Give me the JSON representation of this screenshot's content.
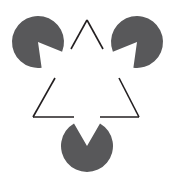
{
  "figure": {
    "canvas": {
      "width": 174,
      "height": 182,
      "background": "#ffffff"
    },
    "colors": {
      "disc_fill": "#58585a",
      "outline_stroke": "#231f20",
      "background": "#ffffff"
    },
    "geometry": {
      "disc_radius": 26,
      "outline_stroke_width": 1.6,
      "notch_half_angle_deg": 30
    },
    "discs": [
      {
        "name": "top-left-pacman",
        "label": "Top-left pac-man disc",
        "cx": 38,
        "cy": 42,
        "r": 26,
        "notch_direction_deg": 52,
        "notch_half_angle_deg": 30,
        "fill": "#58585a"
      },
      {
        "name": "top-right-pacman",
        "label": "Top-right pac-man disc",
        "cx": 137,
        "cy": 42,
        "r": 26,
        "notch_direction_deg": 128,
        "notch_half_angle_deg": 30,
        "fill": "#58585a"
      },
      {
        "name": "bottom-pacman",
        "label": "Bottom pac-man disc",
        "cx": 87,
        "cy": 146,
        "r": 26,
        "notch_direction_deg": 270,
        "notch_half_angle_deg": 30,
        "fill": "#58585a"
      }
    ],
    "outline_triangle": {
      "name": "outlined-triangle",
      "label": "Outlined triangle with occlusion gaps",
      "apex": {
        "x": 87,
        "y": 20
      },
      "bottom_left": {
        "x": 33,
        "y": 117
      },
      "bottom_right": {
        "x": 139,
        "y": 117
      },
      "stroke": "#231f20",
      "stroke_width": 1.6,
      "segments": [
        {
          "name": "left-edge-upper",
          "x1": 87,
          "y1": 20,
          "x2": 71,
          "y2": 49
        },
        {
          "name": "left-edge-lower",
          "x1": 55,
          "y1": 78,
          "x2": 33,
          "y2": 117
        },
        {
          "name": "right-edge-upper",
          "x1": 87,
          "y1": 20,
          "x2": 103,
          "y2": 49
        },
        {
          "name": "right-edge-lower",
          "x1": 119,
          "y1": 78,
          "x2": 139,
          "y2": 117
        },
        {
          "name": "bottom-edge-left",
          "x1": 33,
          "y1": 117,
          "x2": 74,
          "y2": 117
        },
        {
          "name": "bottom-edge-right",
          "x1": 100,
          "y1": 117,
          "x2": 139,
          "y2": 117
        }
      ]
    }
  },
  "chart_data": {
    "type": "diagram",
    "elements": [
      "top-left-pacman",
      "top-right-pacman",
      "bottom-pacman",
      "outlined-triangle"
    ]
  }
}
